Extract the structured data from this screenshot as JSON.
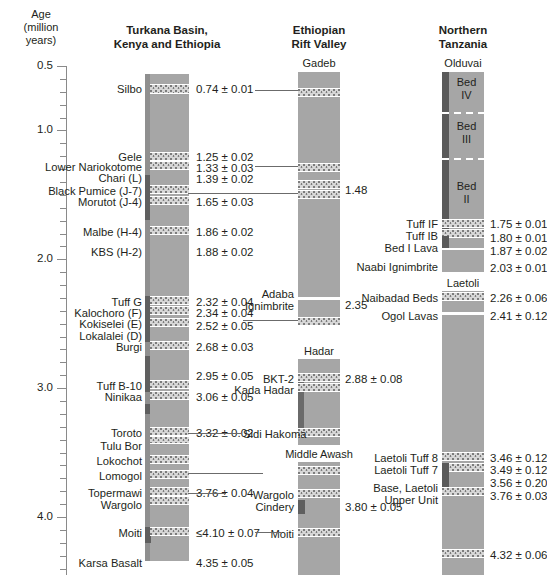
{
  "axis": {
    "title": "Age\n(million\nyears)",
    "major_ticks": [
      {
        "value": "0.5",
        "ma": 0.5
      },
      {
        "value": "1.0",
        "ma": 1.0
      },
      {
        "value": "2.0",
        "ma": 2.0
      },
      {
        "value": "3.0",
        "ma": 3.0
      },
      {
        "value": "4.0",
        "ma": 4.0
      }
    ],
    "range": [
      0.5,
      4.45
    ],
    "minor_step": 0.1
  },
  "columns": {
    "turkana": {
      "header": "Turkana Basin,\nKenya and Ethiopia"
    },
    "ethiopian": {
      "header": "Ethiopian\nRift Valley"
    },
    "tanzania": {
      "header": "Northern\nTanzania"
    }
  },
  "sections": {
    "gadeb": "Gadeb",
    "adaba": "Adaba\nIgnimbrite",
    "hadar": "Hadar",
    "middle_awash": "Middle Awash",
    "olduvai": "Olduvai",
    "laetoli": "Laetoli",
    "beds": [
      "Bed\nIV",
      "Bed\nIII",
      "Bed\nII"
    ]
  },
  "turkana_units": [
    {
      "name": "Silbo",
      "age": "0.74 ± 0.01",
      "ma": 0.74
    },
    {
      "name": "Gele",
      "age": "1.25 ± 0.02",
      "ma": 1.25
    },
    {
      "name": "Lower Nariokotome",
      "age": "1.33 ± 0.03",
      "ma": 1.33
    },
    {
      "name": "Chari (L)",
      "age": "1.39 ± 0.02",
      "ma": 1.39
    },
    {
      "name": "Black Pumice (J-7)",
      "age": "",
      "ma": 1.54
    },
    {
      "name": "Morutot (J-4)",
      "age": "1.65 ± 0.03",
      "ma": 1.65
    },
    {
      "name": "Malbe (H-4)",
      "age": "1.86 ± 0.02",
      "ma": 1.86
    },
    {
      "name": "KBS (H-2)",
      "age": "1.88 ± 0.02",
      "ma": 1.88
    },
    {
      "name": "Tuff G",
      "age": "2.32 ± 0.04",
      "ma": 2.32
    },
    {
      "name": "Kalochoro (F)",
      "age": "2.34 ± 0.04",
      "ma": 2.34
    },
    {
      "name": "Kokiselei (E)",
      "age": "2.52 ± 0.05",
      "ma": 2.45
    },
    {
      "name": "Lokalalei (D)",
      "age": "",
      "ma": 2.52
    },
    {
      "name": "Burgi",
      "age": "2.68 ± 0.03",
      "ma": 2.68
    },
    {
      "name": "",
      "age": "2.95 ± 0.05",
      "ma": 2.95
    },
    {
      "name": "Tuff B-10",
      "age": "",
      "ma": 2.98
    },
    {
      "name": "Ninikaa",
      "age": "3.06 ± 0.05",
      "ma": 3.06
    },
    {
      "name": "Toroto",
      "age": "3.32 ± 0.02",
      "ma": 3.32
    },
    {
      "name": "Tulu Bor",
      "age": "",
      "ma": 3.4
    },
    {
      "name": "Lokochot",
      "age": "",
      "ma": 3.51
    },
    {
      "name": "Lomogol",
      "age": "",
      "ma": 3.6
    },
    {
      "name": "Topermawi",
      "age": "3.76 ± 0.04",
      "ma": 3.72
    },
    {
      "name": "Wargolo",
      "age": "",
      "ma": 3.79
    },
    {
      "name": "Moiti",
      "age": "≤4.10 ± 0.07",
      "ma": 4.1
    },
    {
      "name": "Karsa Basalt",
      "age": "4.35 ± 0.05",
      "ma": 4.35
    }
  ],
  "ethiopian_units": [
    {
      "name": "",
      "age": "1.48",
      "ma": 1.48
    },
    {
      "name": "Adaba\nIgnimbrite",
      "age": "2.35",
      "ma": 2.35
    },
    {
      "name": "BKT-2",
      "age": "2.88 ± 0.08",
      "ma": 2.88
    },
    {
      "name": "Kada Hadar",
      "age": "",
      "ma": 2.96
    },
    {
      "name": "Sidi Hakoma",
      "age": "",
      "ma": 3.35
    },
    {
      "name": "Wargolo",
      "age": "",
      "ma": 3.76
    },
    {
      "name": "Cindery",
      "age": "3.80 ± 0.05",
      "ma": 3.83
    },
    {
      "name": "Moiti",
      "age": "",
      "ma": 4.1
    }
  ],
  "tanzania_units": [
    {
      "name": "Tuff IF",
      "age": "1.75 ± 0.01",
      "ma": 1.75
    },
    {
      "name": "Tuff IB",
      "age": "1.80 ± 0.01",
      "ma": 1.8
    },
    {
      "name": "Bed I Lava",
      "age": "1.87 ± 0.02",
      "ma": 1.87
    },
    {
      "name": "Naabi Ignimbrite",
      "age": "2.03 ± 0.01",
      "ma": 2.03
    },
    {
      "name": "Naibadad Beds",
      "age": "2.26 ± 0.06",
      "ma": 2.26
    },
    {
      "name": "Ogol Lavas",
      "age": "2.41 ± 0.12",
      "ma": 2.41
    },
    {
      "name": "Laetoli Tuff 8",
      "age": "3.46 ± 0.12",
      "ma": 3.46
    },
    {
      "name": "Laetoli Tuff 7",
      "age": "3.49 ± 0.12",
      "ma": 3.49
    },
    {
      "name": "",
      "age": "3.56 ± 0.20",
      "ma": 3.56
    },
    {
      "name": "Base, Laetoli\nUpper Unit",
      "age": "3.76 ± 0.03",
      "ma": 3.76
    },
    {
      "name": "",
      "age": "4.32 ± 0.06",
      "ma": 4.32
    }
  ],
  "chart_data": {
    "type": "table",
    "ylabel": "Age (million years)",
    "ylim": [
      0.5,
      4.45
    ],
    "y_inverted": true,
    "grid": false,
    "legend": "none",
    "series": [
      {
        "name": "Turkana Basin, Kenya and Ethiopia",
        "x_position": 166,
        "markers": [
          {
            "label": "Silbo",
            "value": 0.74,
            "error": 0.01
          },
          {
            "label": "Gele",
            "value": 1.25,
            "error": 0.02
          },
          {
            "label": "Lower Nariokotome",
            "value": 1.33,
            "error": 0.03
          },
          {
            "label": "Chari (L)",
            "value": 1.39,
            "error": 0.02
          },
          {
            "label": "Black Pumice (J-7)",
            "value": null,
            "error": null
          },
          {
            "label": "Morutot (J-4)",
            "value": 1.65,
            "error": 0.03
          },
          {
            "label": "Malbe (H-4)",
            "value": 1.86,
            "error": 0.02
          },
          {
            "label": "KBS (H-2)",
            "value": 1.88,
            "error": 0.02
          },
          {
            "label": "Tuff G",
            "value": 2.32,
            "error": 0.04
          },
          {
            "label": "Kalochoro (F)",
            "value": 2.34,
            "error": 0.04
          },
          {
            "label": "Kokiselei (E)",
            "value": 2.52,
            "error": 0.05
          },
          {
            "label": "Lokalalei (D)",
            "value": null,
            "error": null
          },
          {
            "label": "Burgi",
            "value": 2.68,
            "error": 0.03
          },
          {
            "label": "Tuff B-10",
            "value": 2.95,
            "error": 0.05
          },
          {
            "label": "Ninikaa",
            "value": 3.06,
            "error": 0.05
          },
          {
            "label": "Toroto",
            "value": 3.32,
            "error": 0.02
          },
          {
            "label": "Tulu Bor",
            "value": null,
            "error": null
          },
          {
            "label": "Lokochot",
            "value": null,
            "error": null
          },
          {
            "label": "Lomogol",
            "value": null,
            "error": null
          },
          {
            "label": "Topermawi",
            "value": 3.76,
            "error": 0.04
          },
          {
            "label": "Wargolo",
            "value": null,
            "error": null
          },
          {
            "label": "Moiti",
            "value": 4.1,
            "error": 0.07,
            "qualifier": "≤"
          },
          {
            "label": "Karsa Basalt",
            "value": 4.35,
            "error": 0.05
          }
        ]
      },
      {
        "name": "Ethiopian Rift Valley",
        "x_position": 318,
        "sections": [
          "Gadeb",
          "Adaba Ignimbrite",
          "Hadar",
          "Middle Awash"
        ],
        "markers": [
          {
            "label": "Gadeb tuff",
            "value": 1.48,
            "error": null
          },
          {
            "label": "Adaba Ignimbrite",
            "value": 2.35,
            "error": null
          },
          {
            "label": "BKT-2",
            "value": 2.88,
            "error": 0.08
          },
          {
            "label": "Kada Hadar",
            "value": null,
            "error": null
          },
          {
            "label": "Sidi Hakoma",
            "value": null,
            "error": null
          },
          {
            "label": "Wargolo",
            "value": null,
            "error": null
          },
          {
            "label": "Cindery",
            "value": 3.8,
            "error": 0.05
          },
          {
            "label": "Moiti",
            "value": null,
            "error": null
          }
        ]
      },
      {
        "name": "Northern Tanzania",
        "x_position": 462,
        "sections": [
          "Olduvai",
          "Laetoli"
        ],
        "beds": [
          "Bed IV",
          "Bed III",
          "Bed II"
        ],
        "markers": [
          {
            "label": "Tuff IF",
            "value": 1.75,
            "error": 0.01
          },
          {
            "label": "Tuff IB",
            "value": 1.8,
            "error": 0.01
          },
          {
            "label": "Bed I Lava",
            "value": 1.87,
            "error": 0.02
          },
          {
            "label": "Naabi Ignimbrite",
            "value": 2.03,
            "error": 0.01
          },
          {
            "label": "Naibadad Beds",
            "value": 2.26,
            "error": 0.06
          },
          {
            "label": "Ogol Lavas",
            "value": 2.41,
            "error": 0.12
          },
          {
            "label": "Laetoli Tuff 8",
            "value": 3.46,
            "error": 0.12
          },
          {
            "label": "Laetoli Tuff 7",
            "value": 3.49,
            "error": 0.12
          },
          {
            "label": "unnamed tuff",
            "value": 3.56,
            "error": 0.2
          },
          {
            "label": "Base, Laetoli Upper Unit",
            "value": 3.76,
            "error": 0.03
          },
          {
            "label": "basal tuff",
            "value": 4.32,
            "error": 0.06
          }
        ]
      }
    ],
    "correlations": [
      {
        "from": "Silbo",
        "to": "Gadeb tuff 1"
      },
      {
        "from": "Lower Nariokotome",
        "to": "Gadeb tuff 2"
      },
      {
        "from": "Morutot (J-4)",
        "to": "Gadeb 1.48"
      },
      {
        "from": "Kokiselei (E)",
        "to": "Adaba Ignimbrite base"
      },
      {
        "from": "Toroto",
        "to": "Sidi Hakoma"
      },
      {
        "from": "Lomogol",
        "to": "Middle Awash upper"
      },
      {
        "from": "Topermawi",
        "to": "Wargolo"
      },
      {
        "from": "Moiti (Turkana)",
        "to": "Moiti (Middle Awash)"
      }
    ]
  }
}
